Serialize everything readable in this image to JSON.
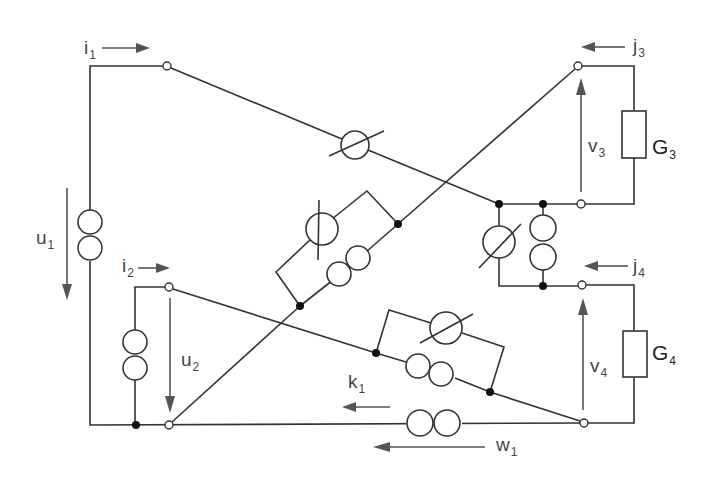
{
  "diagram": {
    "type": "electrical circuit",
    "labels": {
      "i1": {
        "base": "i",
        "sub": "1"
      },
      "i2": {
        "base": "i",
        "sub": "2"
      },
      "j3": {
        "base": "j",
        "sub": "3"
      },
      "j4": {
        "base": "j",
        "sub": "4"
      },
      "u1": {
        "base": "u",
        "sub": "1"
      },
      "u2": {
        "base": "u",
        "sub": "2"
      },
      "v3": {
        "base": "v",
        "sub": "3"
      },
      "v4": {
        "base": "v",
        "sub": "4"
      },
      "G3": {
        "base": "G",
        "sub": "3"
      },
      "G4": {
        "base": "G",
        "sub": "4"
      },
      "k1": {
        "base": "k",
        "sub": "1"
      },
      "w1": {
        "base": "w",
        "sub": "1"
      }
    },
    "components": [
      {
        "id": "source-u1",
        "kind": "voltage-source (double circle)",
        "branch": "left outer vertical"
      },
      {
        "id": "source-left-inner",
        "kind": "voltage-source (double circle)",
        "branch": "port 2 shunt"
      },
      {
        "id": "varres-top",
        "kind": "variable resistor",
        "branch": "port1 top to center node"
      },
      {
        "id": "box-center-upper",
        "kind": "variable resistor parallel with double-circle source",
        "branch": "diagonal"
      },
      {
        "id": "box-center-right",
        "kind": "variable resistor parallel with double-circle source",
        "branch": "between v3 and v4 ports"
      },
      {
        "id": "box-lower",
        "kind": "variable resistor parallel with double-circle source",
        "branch": "port2 top to port4 bottom"
      },
      {
        "id": "source-bottom",
        "kind": "double-circle source",
        "branch": "bottom wire"
      },
      {
        "id": "G3",
        "kind": "resistor",
        "branch": "port 3 load"
      },
      {
        "id": "G4",
        "kind": "resistor",
        "branch": "port 4 load"
      }
    ]
  }
}
